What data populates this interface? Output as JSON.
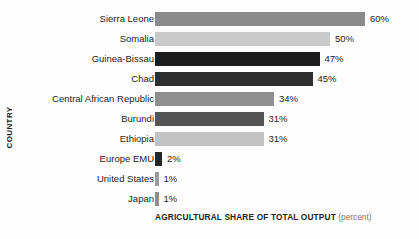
{
  "chart_data": {
    "type": "bar",
    "orientation": "horizontal",
    "title": "",
    "xlabel": "AGRICULTURAL SHARE OF TOTAL OUTPUT",
    "xlabel_unit": "(percent)",
    "ylabel": "COUNTRY",
    "xlim": [
      0,
      60
    ],
    "grid": false,
    "legend": "none",
    "categories": [
      "Sierra Leone",
      "Somalia",
      "Guinea-Bissau",
      "Chad",
      "Central African Republic",
      "Burundi",
      "Ethiopia",
      "Europe EMU",
      "United States",
      "Japan"
    ],
    "values": [
      60,
      50,
      47,
      45,
      34,
      31,
      31,
      2,
      1,
      1
    ],
    "value_labels": [
      "60%",
      "50%",
      "47%",
      "45%",
      "34%",
      "31%",
      "31%",
      "2%",
      "1%",
      "1%"
    ],
    "bar_colors": [
      "#8b8b8b",
      "#c9c9c9",
      "#1c1c1c",
      "#2e2e2e",
      "#8f8f8f",
      "#555555",
      "#c2c2c2",
      "#262626",
      "#9a9a9a",
      "#8f8f8f"
    ],
    "bars": [
      {
        "category": "Sierra Leone",
        "value": 60,
        "label": "60%",
        "color": "#8b8b8b"
      },
      {
        "category": "Somalia",
        "value": 50,
        "label": "50%",
        "color": "#c9c9c9"
      },
      {
        "category": "Guinea-Bissau",
        "value": 47,
        "label": "47%",
        "color": "#1c1c1c"
      },
      {
        "category": "Chad",
        "value": 45,
        "label": "45%",
        "color": "#2e2e2e"
      },
      {
        "category": "Central African Republic",
        "value": 34,
        "label": "34%",
        "color": "#8f8f8f"
      },
      {
        "category": "Burundi",
        "value": 31,
        "label": "31%",
        "color": "#555555"
      },
      {
        "category": "Ethiopia",
        "value": 31,
        "label": "31%",
        "color": "#c2c2c2"
      },
      {
        "category": "Europe EMU",
        "value": 2,
        "label": "2%",
        "color": "#262626"
      },
      {
        "category": "United States",
        "value": 1,
        "label": "1%",
        "color": "#9a9a9a"
      },
      {
        "category": "Japan",
        "value": 1,
        "label": "1%",
        "color": "#8f8f8f"
      }
    ]
  }
}
